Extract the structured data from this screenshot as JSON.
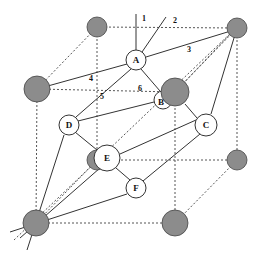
{
  "diagram": {
    "type": "crystal-unit-cell",
    "colors": {
      "dark_atom": "#8c8c8c",
      "light_atom": "#ffffff",
      "line": "#333333",
      "dash": "#555555"
    },
    "atoms_labeled": [
      {
        "id": "A",
        "label": "A",
        "x": 136,
        "y": 60,
        "r": 10
      },
      {
        "id": "B",
        "label": "B",
        "x": 163,
        "y": 100,
        "r": 9
      },
      {
        "id": "C",
        "label": "C",
        "x": 206,
        "y": 125,
        "r": 11
      },
      {
        "id": "D",
        "label": "D",
        "x": 69,
        "y": 125,
        "r": 10
      },
      {
        "id": "E",
        "label": "E",
        "x": 107,
        "y": 158,
        "r": 13
      },
      {
        "id": "F",
        "label": "F",
        "x": 136,
        "y": 188,
        "r": 10
      }
    ],
    "atoms_corner": [
      {
        "id": "c1",
        "x": 97,
        "y": 27,
        "r": 10
      },
      {
        "id": "c2",
        "x": 237,
        "y": 28,
        "r": 10
      },
      {
        "id": "c3",
        "x": 37,
        "y": 89,
        "r": 13
      },
      {
        "id": "c4",
        "x": 175,
        "y": 92,
        "r": 14
      },
      {
        "id": "c5",
        "x": 97,
        "y": 160,
        "r": 10
      },
      {
        "id": "c6",
        "x": 237,
        "y": 160,
        "r": 10
      },
      {
        "id": "c7",
        "x": 36,
        "y": 223,
        "r": 13
      },
      {
        "id": "c8",
        "x": 175,
        "y": 223,
        "r": 13
      }
    ],
    "direction_labels": [
      {
        "label": "1",
        "x": 142,
        "y": 21
      },
      {
        "label": "2",
        "x": 173,
        "y": 23
      },
      {
        "label": "3",
        "x": 187,
        "y": 52
      },
      {
        "label": "4",
        "x": 89,
        "y": 81
      },
      {
        "label": "5",
        "x": 100,
        "y": 99
      },
      {
        "label": "6",
        "x": 138,
        "y": 91
      }
    ]
  }
}
